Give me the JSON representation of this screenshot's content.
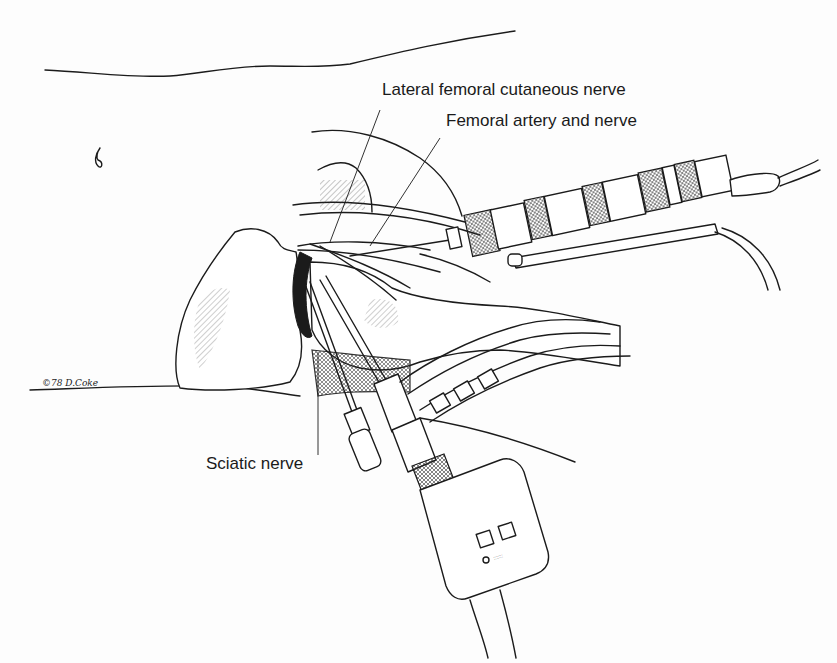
{
  "figure": {
    "type": "medical line illustration",
    "labels": {
      "lateral_femoral_cutaneous_nerve": "Lateral femoral cutaneous nerve",
      "femoral_artery_and_nerve": "Femoral artery and nerve",
      "sciatic_nerve": "Sciatic nerve"
    },
    "signature": "©78 D.Coke",
    "colors": {
      "ink": "#1b1b1b",
      "background": "#fdfdfd"
    }
  }
}
